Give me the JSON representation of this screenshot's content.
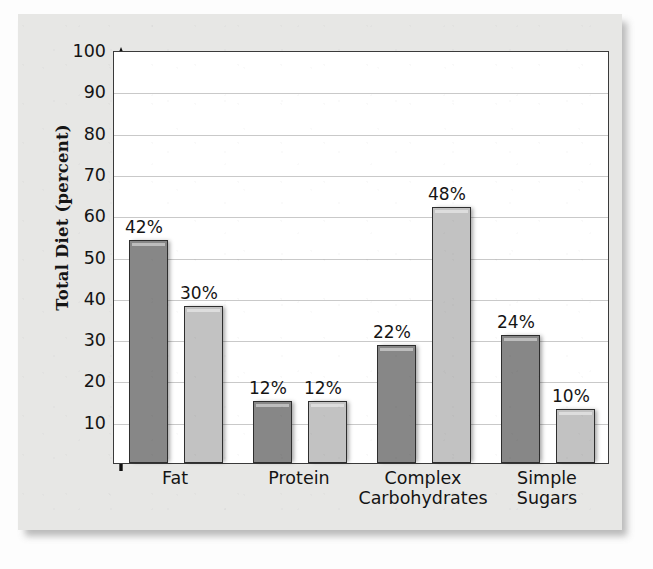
{
  "figure": {
    "y_axis_title": "Total Diet (percent)",
    "panel_color": "#e7e7e5",
    "plot_background": "#ffffff",
    "axis_color": "#3a3a3a",
    "gridline_color": "#c9c9c9",
    "series_colors": {
      "recommended": "#878787",
      "actual": "#c2c2c2"
    }
  },
  "chart_data": {
    "type": "bar",
    "title": "",
    "xlabel": "",
    "ylabel": "Total Diet (percent)",
    "ylim": [
      0,
      100
    ],
    "ytick_labels": [
      "100",
      "90",
      "80",
      "70",
      "60",
      "50",
      "40",
      "30",
      "20",
      "10"
    ],
    "yticks": [
      100,
      90,
      80,
      70,
      60,
      50,
      40,
      30,
      20,
      10
    ],
    "grid": true,
    "legend": "none",
    "categories": [
      "Fat",
      "Protein",
      "Complex\nCarbohydrates",
      "Simple\nSugars"
    ],
    "series": [
      {
        "name": "series-1",
        "color": "#878787",
        "labels": [
          "42%",
          "12%",
          "22%",
          "24%"
        ],
        "values": [
          42,
          12,
          22,
          24
        ],
        "plotted_heights": [
          54,
          15,
          28.5,
          31
        ]
      },
      {
        "name": "series-2",
        "color": "#c2c2c2",
        "labels": [
          "30%",
          "12%",
          "48%",
          "10%"
        ],
        "values": [
          30,
          12,
          48,
          10
        ],
        "plotted_heights": [
          38,
          15,
          62,
          13
        ]
      }
    ],
    "bars": [
      {
        "group": "Fat",
        "series": 0,
        "label": "42%",
        "value": 42,
        "plotted": 54,
        "shade": "dark"
      },
      {
        "group": "Fat",
        "series": 1,
        "label": "30%",
        "value": 30,
        "plotted": 38,
        "shade": "light"
      },
      {
        "group": "Protein",
        "series": 0,
        "label": "12%",
        "value": 12,
        "plotted": 15,
        "shade": "dark"
      },
      {
        "group": "Protein",
        "series": 1,
        "label": "12%",
        "value": 12,
        "plotted": 15,
        "shade": "light"
      },
      {
        "group": "Complex Carbohydrates",
        "series": 0,
        "label": "22%",
        "value": 22,
        "plotted": 28.5,
        "shade": "dark"
      },
      {
        "group": "Complex Carbohydrates",
        "series": 1,
        "label": "48%",
        "value": 48,
        "plotted": 62,
        "shade": "light"
      },
      {
        "group": "Simple Sugars",
        "series": 0,
        "label": "24%",
        "value": 24,
        "plotted": 31,
        "shade": "dark"
      },
      {
        "group": "Simple Sugars",
        "series": 1,
        "label": "10%",
        "value": 10,
        "plotted": 13,
        "shade": "light"
      }
    ]
  }
}
